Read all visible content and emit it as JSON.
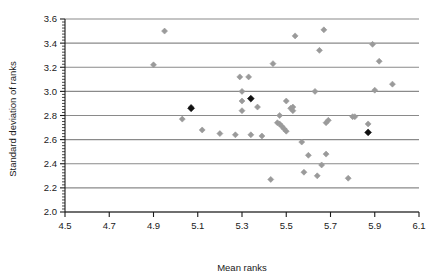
{
  "chart_data": {
    "type": "scatter",
    "title": "",
    "xlabel": "Mean ranks",
    "ylabel": "Standard deviation of ranks",
    "xlim": [
      4.5,
      6.1
    ],
    "ylim": [
      2.0,
      3.6
    ],
    "xticks": [
      "4.5",
      "4.7",
      "4.9",
      "5.1",
      "5.3",
      "5.5",
      "5.7",
      "5.9",
      "6.1"
    ],
    "xtick_values": [
      4.5,
      4.7,
      4.9,
      5.1,
      5.3,
      5.5,
      5.7,
      5.9,
      6.1
    ],
    "yticks": [
      "2.0",
      "2.2",
      "2.4",
      "2.6",
      "2.8",
      "3.0",
      "3.2",
      "3.4",
      "3.6"
    ],
    "ytick_values": [
      2.0,
      2.2,
      2.4,
      2.6,
      2.8,
      3.0,
      3.2,
      3.4,
      3.6
    ],
    "grid": "horizontal",
    "legend": "none",
    "minor_ticks": true,
    "marker": "diamond",
    "series": [
      {
        "name": "items",
        "color": "#9a9a9a",
        "points": [
          [
            4.9,
            3.22
          ],
          [
            4.95,
            3.5
          ],
          [
            5.03,
            2.77
          ],
          [
            5.07,
            2.87
          ],
          [
            5.07,
            2.86
          ],
          [
            5.12,
            2.68
          ],
          [
            5.2,
            2.65
          ],
          [
            5.27,
            2.64
          ],
          [
            5.29,
            3.12
          ],
          [
            5.3,
            3.0
          ],
          [
            5.3,
            2.92
          ],
          [
            5.3,
            2.84
          ],
          [
            5.33,
            3.12
          ],
          [
            5.34,
            2.64
          ],
          [
            5.37,
            2.87
          ],
          [
            5.39,
            2.63
          ],
          [
            5.43,
            2.27
          ],
          [
            5.44,
            3.23
          ],
          [
            5.46,
            2.74
          ],
          [
            5.47,
            2.73
          ],
          [
            5.47,
            2.8
          ],
          [
            5.48,
            2.71
          ],
          [
            5.49,
            2.69
          ],
          [
            5.5,
            2.92
          ],
          [
            5.5,
            2.67
          ],
          [
            5.52,
            2.86
          ],
          [
            5.53,
            2.84
          ],
          [
            5.53,
            2.87
          ],
          [
            5.54,
            3.46
          ],
          [
            5.57,
            2.58
          ],
          [
            5.58,
            2.33
          ],
          [
            5.6,
            2.47
          ],
          [
            5.63,
            3.0
          ],
          [
            5.64,
            2.3
          ],
          [
            5.65,
            3.34
          ],
          [
            5.66,
            2.39
          ],
          [
            5.67,
            3.51
          ],
          [
            5.68,
            2.48
          ],
          [
            5.68,
            2.74
          ],
          [
            5.69,
            2.76
          ],
          [
            5.78,
            2.28
          ],
          [
            5.8,
            2.79
          ],
          [
            5.81,
            2.79
          ],
          [
            5.87,
            2.73
          ],
          [
            5.89,
            3.39
          ],
          [
            5.9,
            3.01
          ],
          [
            5.92,
            3.25
          ],
          [
            5.98,
            3.06
          ]
        ]
      },
      {
        "name": "highlighted",
        "color": "#111111",
        "points": [
          [
            5.07,
            2.86
          ],
          [
            5.34,
            2.94
          ],
          [
            5.87,
            2.66
          ]
        ]
      }
    ]
  }
}
